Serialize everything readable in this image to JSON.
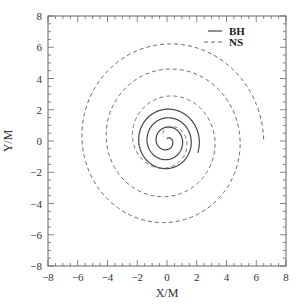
{
  "chart_data": {
    "type": "line",
    "title": "",
    "xlabel": "X/M",
    "ylabel": "Y/M",
    "xlim": [
      -8,
      8
    ],
    "ylim": [
      -8,
      8
    ],
    "xticks": [
      -8,
      -6,
      -4,
      -2,
      0,
      2,
      4,
      6,
      8
    ],
    "yticks": [
      -8,
      -6,
      -4,
      -2,
      0,
      2,
      4,
      6,
      8
    ],
    "xtick_labels": [
      "−8",
      "−6",
      "−4",
      "−2",
      "0",
      "2",
      "4",
      "6",
      "8"
    ],
    "ytick_labels": [
      "−8",
      "−6",
      "−4",
      "−2",
      "0",
      "2",
      "4",
      "6",
      "8"
    ],
    "grid": false,
    "legend_position": "upper right",
    "legend": [
      {
        "label": "BH",
        "style": "solid"
      },
      {
        "label": "NS",
        "style": "dashed"
      }
    ],
    "series": [
      {
        "name": "BH",
        "style": "solid",
        "description": "Tight inward spiral of black hole orbit centered near origin",
        "spiral": {
          "cx": 0.0,
          "cy": 0.0,
          "r_start": 2.2,
          "r_end": 0.15,
          "theta_start_deg": -20,
          "turns": 3.3,
          "direction": "ccw"
        },
        "extent": {
          "x": [
            -2.1,
            2.0
          ],
          "y": [
            -2.1,
            2.1
          ]
        }
      },
      {
        "name": "NS",
        "style": "dashed",
        "description": "Wide inward spiral of neutron star orbit, ending in merger near origin",
        "spiral": {
          "cx": 0.0,
          "cy": 0.1,
          "r_start": 6.5,
          "r_end": 0.3,
          "theta_start_deg": 0,
          "turns": 3.4,
          "direction": "ccw"
        },
        "extent": {
          "x": [
            -6.1,
            6.5
          ],
          "y": [
            -5.9,
            6.4
          ]
        },
        "arc_crossings": {
          "top_y": [
            6.4,
            5.3,
            4.6,
            3.5
          ],
          "bottom_y": [
            -5.9,
            -5.5,
            -4.2
          ],
          "left_x": [
            -6.1,
            -5.4,
            -4.5
          ],
          "right_end": [
            6.5,
            0.0
          ]
        }
      }
    ]
  },
  "plot": {
    "left_px": 48,
    "top_px": 16,
    "right_px": 286,
    "bottom_px": 266,
    "line_color": "#444444",
    "dash_color": "#666666",
    "frame_color": "#666666"
  }
}
